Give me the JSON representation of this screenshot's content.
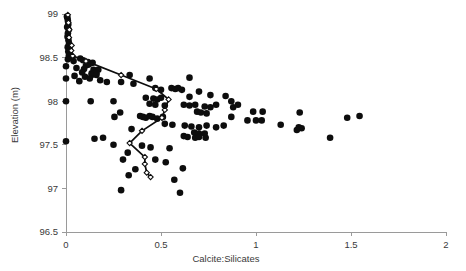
{
  "chart_data": {
    "type": "scatter",
    "title": "",
    "xlabel": "Calcite:Silicates",
    "ylabel": "Elevation (m)",
    "xlim": [
      0,
      2
    ],
    "ylim": [
      96.5,
      99
    ],
    "xticks": [
      "0",
      "0.5",
      "1",
      "1.5",
      "2"
    ],
    "xtick_values": [
      0,
      0.5,
      1,
      1.5,
      2
    ],
    "yticks": [
      "96.5",
      "97",
      "97.5",
      "98",
      "98.5",
      "99"
    ],
    "ytick_values": [
      96.5,
      97,
      97.5,
      98,
      98.5,
      99
    ],
    "grid": false,
    "legend": null,
    "series": [
      {
        "name": "Samples",
        "type": "scatter",
        "marker": "filled-circle",
        "color": "#0d0d0d",
        "points": [
          [
            0.005,
            98.97
          ],
          [
            0.008,
            98.95
          ],
          [
            0.01,
            98.92
          ],
          [
            0.012,
            98.88
          ],
          [
            0.006,
            98.85
          ],
          [
            0.014,
            98.82
          ],
          [
            0.01,
            98.78
          ],
          [
            0.008,
            98.74
          ],
          [
            0.013,
            98.7
          ],
          [
            0.016,
            98.66
          ],
          [
            0.009,
            98.62
          ],
          [
            0.018,
            98.6
          ],
          [
            0.012,
            98.57
          ],
          [
            0.02,
            98.55
          ],
          [
            0.015,
            98.52
          ],
          [
            0.03,
            98.5
          ],
          [
            0.01,
            98.48
          ],
          [
            0.04,
            98.46
          ],
          [
            0.075,
            98.49
          ],
          [
            0.09,
            98.47
          ],
          [
            0.115,
            98.45
          ],
          [
            0.14,
            98.44
          ],
          [
            0.105,
            98.41
          ],
          [
            0.12,
            98.42
          ],
          [
            0.0,
            98.4
          ],
          [
            0.055,
            98.38
          ],
          [
            0.095,
            98.37
          ],
          [
            0.145,
            98.36
          ],
          [
            0.17,
            98.36
          ],
          [
            0.085,
            98.33
          ],
          [
            0.135,
            98.32
          ],
          [
            0.16,
            98.32
          ],
          [
            0.135,
            98.3
          ],
          [
            0.16,
            98.3
          ],
          [
            0.045,
            98.29
          ],
          [
            0.1,
            98.28
          ],
          [
            0.0,
            98.26
          ],
          [
            0.125,
            98.26
          ],
          [
            0.07,
            98.23
          ],
          [
            0.18,
            98.24
          ],
          [
            0.215,
            98.22
          ],
          [
            0.29,
            98.22
          ],
          [
            0.0,
            98.0
          ],
          [
            0.13,
            98.0
          ],
          [
            0.25,
            98.0
          ],
          [
            0.335,
            98.3
          ],
          [
            0.44,
            98.26
          ],
          [
            0.355,
            98.2
          ],
          [
            0.65,
            98.27
          ],
          [
            0.47,
            98.15
          ],
          [
            0.5,
            98.13
          ],
          [
            0.555,
            98.15
          ],
          [
            0.575,
            98.14
          ],
          [
            0.59,
            98.15
          ],
          [
            0.61,
            98.13
          ],
          [
            0.7,
            98.11
          ],
          [
            0.65,
            98.05
          ],
          [
            0.76,
            98.07
          ],
          [
            0.84,
            98.06
          ],
          [
            0.42,
            98.04
          ],
          [
            0.46,
            98.03
          ],
          [
            0.48,
            98.02
          ],
          [
            0.5,
            98.04
          ],
          [
            0.44,
            97.97
          ],
          [
            0.47,
            97.96
          ],
          [
            0.52,
            97.95
          ],
          [
            0.62,
            97.96
          ],
          [
            0.65,
            97.95
          ],
          [
            0.68,
            97.96
          ],
          [
            0.73,
            97.94
          ],
          [
            0.76,
            97.93
          ],
          [
            0.79,
            97.96
          ],
          [
            0.88,
            97.93
          ],
          [
            0.905,
            97.96
          ],
          [
            0.87,
            98.0
          ],
          [
            0.69,
            97.88
          ],
          [
            0.71,
            97.87
          ],
          [
            0.74,
            97.86
          ],
          [
            0.285,
            97.87
          ],
          [
            0.255,
            97.82
          ],
          [
            0.39,
            97.83
          ],
          [
            0.405,
            97.82
          ],
          [
            0.42,
            97.81
          ],
          [
            0.44,
            97.83
          ],
          [
            0.455,
            97.82
          ],
          [
            0.48,
            97.8
          ],
          [
            0.51,
            97.82
          ],
          [
            0.87,
            97.82
          ],
          [
            0.985,
            97.88
          ],
          [
            0.955,
            97.78
          ],
          [
            1.0,
            97.78
          ],
          [
            1.03,
            97.78
          ],
          [
            1.035,
            97.88
          ],
          [
            1.23,
            97.87
          ],
          [
            1.48,
            97.81
          ],
          [
            1.545,
            97.83
          ],
          [
            1.13,
            97.73
          ],
          [
            0.52,
            97.74
          ],
          [
            0.56,
            97.73
          ],
          [
            0.625,
            97.72
          ],
          [
            0.66,
            97.71
          ],
          [
            0.7,
            97.7
          ],
          [
            0.74,
            97.72
          ],
          [
            0.79,
            97.7
          ],
          [
            0.83,
            97.72
          ],
          [
            1.225,
            97.7
          ],
          [
            1.24,
            97.69
          ],
          [
            1.215,
            97.67
          ],
          [
            0.345,
            97.68
          ],
          [
            0.675,
            97.64
          ],
          [
            0.7,
            97.63
          ],
          [
            0.73,
            97.63
          ],
          [
            0.62,
            97.6
          ],
          [
            0.64,
            97.59
          ],
          [
            0.68,
            97.58
          ],
          [
            0.7,
            97.59
          ],
          [
            0.735,
            97.58
          ],
          [
            1.39,
            97.58
          ],
          [
            0.15,
            97.57
          ],
          [
            0.195,
            97.58
          ],
          [
            0.0,
            97.54
          ],
          [
            0.25,
            97.5
          ],
          [
            0.4,
            97.49
          ],
          [
            0.445,
            97.47
          ],
          [
            0.545,
            97.46
          ],
          [
            0.325,
            97.41
          ],
          [
            0.3,
            97.33
          ],
          [
            0.47,
            97.33
          ],
          [
            0.525,
            97.3
          ],
          [
            0.365,
            97.22
          ],
          [
            0.615,
            97.23
          ],
          [
            0.33,
            97.15
          ],
          [
            0.57,
            97.1
          ],
          [
            0.29,
            96.98
          ],
          [
            0.6,
            96.95
          ]
        ]
      },
      {
        "name": "Profile mean",
        "type": "line",
        "marker": "open-diamond",
        "color": "#0d0d0d",
        "points": [
          [
            0.01,
            98.99
          ],
          [
            0.013,
            98.9
          ],
          [
            0.018,
            98.82
          ],
          [
            0.016,
            98.73
          ],
          [
            0.03,
            98.64
          ],
          [
            0.028,
            98.58
          ],
          [
            0.035,
            98.52
          ],
          [
            0.105,
            98.46
          ],
          [
            0.29,
            98.3
          ],
          [
            0.475,
            98.14
          ],
          [
            0.54,
            98.02
          ],
          [
            0.52,
            97.9
          ],
          [
            0.505,
            97.81
          ],
          [
            0.4,
            97.66
          ],
          [
            0.335,
            97.52
          ],
          [
            0.415,
            97.36
          ],
          [
            0.415,
            97.28
          ],
          [
            0.425,
            97.18
          ],
          [
            0.445,
            97.13
          ]
        ]
      }
    ]
  },
  "axes": {
    "x_axis_name": "x-axis",
    "y_axis_name": "y-axis"
  }
}
